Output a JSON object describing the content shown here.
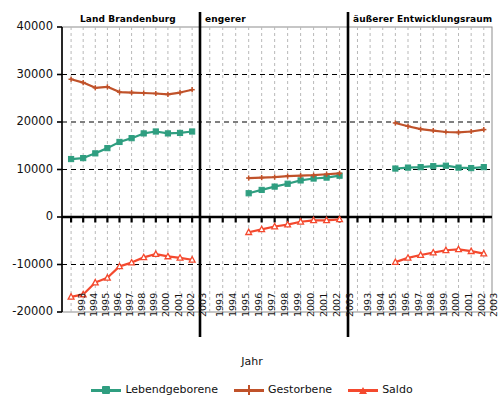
{
  "figure": {
    "x_axis_title": "Jahr",
    "panels": [
      {
        "name": "panel-land-brandenburg",
        "title": "Land Brandenburg"
      },
      {
        "name": "panel-engerer",
        "title": "engerer"
      },
      {
        "name": "panel-aeusserer",
        "title": "äußerer Entwicklungsraum"
      }
    ],
    "y_ticks": [
      "40000",
      "30000",
      "20000",
      "10000",
      "0",
      "-10000",
      "-20000"
    ],
    "x_ticks": [
      "1993",
      "1994",
      "1995",
      "1996",
      "1997",
      "1998",
      "1999",
      "2000",
      "2001",
      "2002",
      "2003"
    ],
    "legend": [
      {
        "label": "Lebendgeborene",
        "color": "#2f9e80",
        "marker": "square",
        "name": "legend-lebendgeborene"
      },
      {
        "label": "Gestorbene",
        "color": "#c0522a",
        "marker": "plus",
        "name": "legend-gestorbene"
      },
      {
        "label": "Saldo",
        "color": "#f4492e",
        "marker": "triangle",
        "name": "legend-saldo"
      }
    ]
  },
  "chart_data": {
    "type": "line",
    "title": "",
    "xlabel": "Jahr",
    "ylabel": "",
    "ylim": [
      -20000,
      40000
    ],
    "yticks": [
      -20000,
      -10000,
      0,
      10000,
      20000,
      30000,
      40000
    ],
    "grid": true,
    "legend_position": "bottom",
    "x": [
      1993,
      1994,
      1995,
      1996,
      1997,
      1998,
      1999,
      2000,
      2001,
      2002,
      2003
    ],
    "panels": [
      {
        "title": "Land Brandenburg",
        "series": [
          {
            "name": "Lebendgeborene",
            "color": "#2f9e80",
            "x": [
              1993,
              1994,
              1995,
              1996,
              1997,
              1998,
              1999,
              2000,
              2001,
              2002,
              2003
            ],
            "values": [
              12200,
              12400,
              13400,
              14500,
              15800,
              16600,
              17600,
              18000,
              17600,
              17700,
              18000
            ]
          },
          {
            "name": "Gestorbene",
            "color": "#c0522a",
            "x": [
              1993,
              1994,
              1995,
              1996,
              1997,
              1998,
              1999,
              2000,
              2001,
              2002,
              2003
            ],
            "values": [
              29000,
              28300,
              27200,
              27400,
              26300,
              26200,
              26100,
              26000,
              25800,
              26200,
              26800
            ]
          },
          {
            "name": "Saldo",
            "color": "#f4492e",
            "x": [
              1993,
              1994,
              1995,
              1996,
              1997,
              1998,
              1999,
              2000,
              2001,
              2002,
              2003
            ],
            "values": [
              -16800,
              -16300,
              -13800,
              -12800,
              -10400,
              -9600,
              -8500,
              -7800,
              -8300,
              -8600,
              -9000
            ]
          }
        ]
      },
      {
        "title": "engerer",
        "series": [
          {
            "name": "Lebendgeborene",
            "color": "#2f9e80",
            "x": [
              1996,
              1997,
              1998,
              1999,
              2000,
              2001,
              2002,
              2003
            ],
            "values": [
              5000,
              5700,
              6400,
              7000,
              7700,
              8100,
              8300,
              8700
            ]
          },
          {
            "name": "Gestorbene",
            "color": "#c0522a",
            "x": [
              1996,
              1997,
              1998,
              1999,
              2000,
              2001,
              2002,
              2003
            ],
            "values": [
              8200,
              8300,
              8400,
              8600,
              8700,
              8800,
              9000,
              9200
            ]
          },
          {
            "name": "Saldo",
            "color": "#f4492e",
            "x": [
              1996,
              1997,
              1998,
              1999,
              2000,
              2001,
              2002,
              2003
            ],
            "values": [
              -3200,
              -2600,
              -2000,
              -1600,
              -1000,
              -700,
              -700,
              -500
            ]
          }
        ]
      },
      {
        "title": "äußerer Entwicklungsraum",
        "series": [
          {
            "name": "Lebendgeborene",
            "color": "#2f9e80",
            "x": [
              1996,
              1997,
              1998,
              1999,
              2000,
              2001,
              2002,
              2003
            ],
            "values": [
              10200,
              10400,
              10500,
              10700,
              10800,
              10400,
              10300,
              10500
            ]
          },
          {
            "name": "Gestorbene",
            "color": "#c0522a",
            "x": [
              1996,
              1997,
              1998,
              1999,
              2000,
              2001,
              2002,
              2003
            ],
            "values": [
              19800,
              19100,
              18500,
              18200,
              17900,
              17800,
              18000,
              18400
            ]
          },
          {
            "name": "Saldo",
            "color": "#f4492e",
            "x": [
              1996,
              1997,
              1998,
              1999,
              2000,
              2001,
              2002,
              2003
            ],
            "values": [
              -9500,
              -8600,
              -8000,
              -7500,
              -7000,
              -6800,
              -7200,
              -7700
            ]
          }
        ]
      }
    ]
  }
}
